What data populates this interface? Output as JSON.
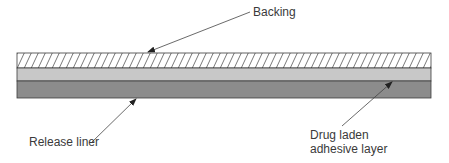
{
  "diagram": {
    "type": "transdermal patch cross-section",
    "layers": [
      {
        "name": "Backing",
        "fill": "hatched",
        "fill_color": "#ffffff",
        "stroke_color": "#555555"
      },
      {
        "name": "Drug laden adhesive layer",
        "fill": "solid",
        "fill_color": "#c8c8c8"
      },
      {
        "name": "Release liner",
        "fill": "solid",
        "fill_color": "#8c8c8c"
      }
    ],
    "labels": {
      "backing": "Backing",
      "release_liner": "Release liner",
      "drug_line1": "Drug laden",
      "drug_line2": "adhesive layer"
    },
    "colors": {
      "outline": "#3c3c3c",
      "arrow": "#444444",
      "text": "#3a3a3a"
    }
  }
}
